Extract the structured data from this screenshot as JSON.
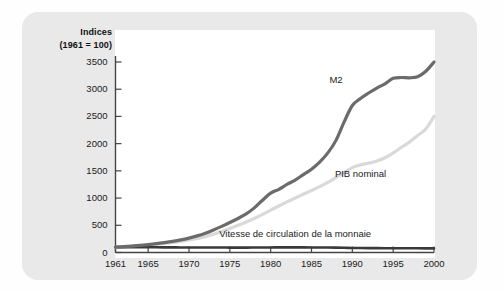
{
  "figure": {
    "background_color": "#e9e9e9",
    "panel_color": "#ffffff",
    "axis_title_line1": "Indices",
    "axis_title_line2": "(1961 = 100)"
  },
  "colors": {
    "m2": "#6b6b6b",
    "pib": "#d9d9d9",
    "vitesse": "#3a3a3a",
    "axis": "#444444",
    "text": "#1a1a1a"
  },
  "chart_data": {
    "type": "line",
    "title": "Indices (1961 = 100)",
    "xlabel": "",
    "ylabel": "Indices (1961 = 100)",
    "xlim": [
      1961,
      2000
    ],
    "ylim": [
      0,
      3500
    ],
    "yticks": [
      0,
      500,
      1000,
      1500,
      2000,
      2500,
      3000,
      3500
    ],
    "ytick_labels": [
      "0",
      "500",
      "1000",
      "1500",
      "2000",
      "2500",
      "3000",
      "3500"
    ],
    "xticks": [
      1961,
      1965,
      1970,
      1975,
      1980,
      1985,
      1990,
      1995,
      2000
    ],
    "xtick_labels": [
      "1961",
      "1965",
      "1970",
      "1975",
      "1980",
      "1985",
      "1990",
      "1995",
      "2000"
    ],
    "grid": false,
    "legend_position": "inline-annotations",
    "x": [
      1961,
      1962,
      1963,
      1964,
      1965,
      1966,
      1967,
      1968,
      1969,
      1970,
      1971,
      1972,
      1973,
      1974,
      1975,
      1976,
      1977,
      1978,
      1979,
      1980,
      1981,
      1982,
      1983,
      1984,
      1985,
      1986,
      1987,
      1988,
      1989,
      1990,
      1991,
      1992,
      1993,
      1994,
      1995,
      1996,
      1997,
      1998,
      1999,
      2000
    ],
    "series": [
      {
        "name": "M2",
        "color": "#6b6b6b",
        "label_x": 1988,
        "label_y": 3150,
        "values": [
          100,
          108,
          118,
          130,
          145,
          162,
          182,
          205,
          232,
          265,
          305,
          355,
          415,
          480,
          550,
          625,
          710,
          820,
          960,
          1090,
          1160,
          1250,
          1330,
          1430,
          1530,
          1660,
          1830,
          2060,
          2400,
          2700,
          2830,
          2930,
          3020,
          3100,
          3200,
          3215,
          3210,
          3230,
          3330,
          3500
        ]
      },
      {
        "name": "PIB nominal",
        "color": "#d9d9d9",
        "label_x": 1991,
        "label_y": 1430,
        "values": [
          100,
          106,
          114,
          124,
          136,
          150,
          166,
          184,
          205,
          230,
          258,
          292,
          335,
          385,
          440,
          500,
          560,
          625,
          700,
          780,
          855,
          930,
          1000,
          1070,
          1140,
          1210,
          1290,
          1380,
          1470,
          1560,
          1610,
          1640,
          1680,
          1740,
          1830,
          1930,
          2030,
          2150,
          2270,
          2500
        ]
      },
      {
        "name": "Vitesse de circulation de la monnaie",
        "color": "#3a3a3a",
        "label_x": 1983,
        "label_y": 330,
        "values": [
          100,
          99,
          98,
          97,
          96,
          96,
          95,
          94,
          93,
          93,
          92,
          92,
          91,
          91,
          90,
          90,
          90,
          91,
          92,
          93,
          94,
          95,
          95,
          94,
          93,
          92,
          91,
          89,
          86,
          83,
          82,
          81,
          80,
          79,
          78,
          78,
          78,
          77,
          76,
          75
        ]
      }
    ]
  }
}
